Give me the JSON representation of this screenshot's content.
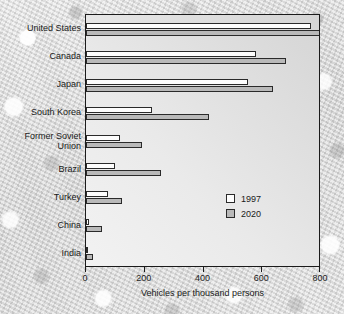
{
  "chart_data": {
    "type": "bar",
    "orientation": "horizontal",
    "title": "",
    "xlabel": "Vehicles per thousand persons",
    "ylabel": "",
    "xlim": [
      0,
      800
    ],
    "xticks": [
      0,
      200,
      400,
      600,
      800
    ],
    "xtick_labels": [
      "0",
      "200",
      "400",
      "600",
      "800"
    ],
    "grid": false,
    "legend_position": "inside lower-right",
    "categories": [
      "United States",
      "Canada",
      "Japan",
      "South Korea",
      "Former Soviet\nUnion",
      "Brazil",
      "Turkey",
      "China",
      "India"
    ],
    "series": [
      {
        "name": "1997",
        "color": "#fdfdfd",
        "values": [
          765,
          580,
          550,
          225,
          115,
          98,
          75,
          10,
          8
        ]
      },
      {
        "name": "2020",
        "color": "#b9b9b9",
        "values": [
          795,
          680,
          635,
          420,
          190,
          255,
          122,
          55,
          25
        ]
      }
    ]
  },
  "legend": {
    "entries": [
      {
        "label": "1997"
      },
      {
        "label": "2020"
      }
    ]
  },
  "axis": {
    "x_title": "Vehicles per thousand persons"
  }
}
